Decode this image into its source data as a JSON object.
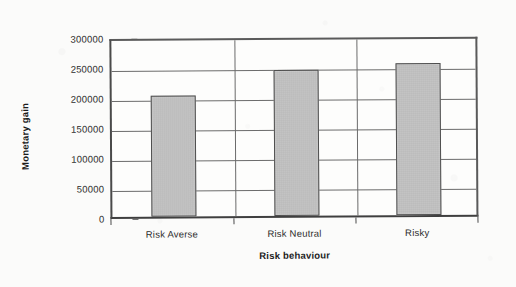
{
  "chart_data": {
    "type": "bar",
    "title": "",
    "subtitle": "",
    "xlabel": "Risk behaviour",
    "ylabel": "Monetary gain",
    "categories": [
      "Risk Averse",
      "Risk Neutral",
      "Risky"
    ],
    "values": [
      202500,
      244000,
      254000
    ],
    "ylim": [
      0,
      300000
    ],
    "yticks": [
      0,
      50000,
      100000,
      150000,
      200000,
      250000,
      300000
    ],
    "ytick_labels": [
      "0",
      "50000",
      "100000",
      "150000",
      "200000",
      "250000",
      "300000"
    ],
    "grid": "horizontal-and-vertical",
    "legend": "none",
    "bar_color": "#c2c2c2",
    "bar_border_color": "#4f4f4f",
    "axis_color": "#4a4a4a",
    "gridline_color": "#6b6b6b",
    "background_color": "#fbfbfa",
    "annotations": []
  },
  "axes": {
    "y_title": "Monetary gain",
    "x_title": "Risk behaviour"
  }
}
